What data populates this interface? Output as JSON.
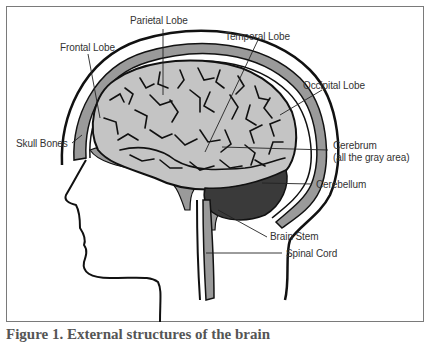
{
  "figure": {
    "labels": {
      "parietal_lobe": "Parietal Lobe",
      "frontal_lobe": "Frontal Lobe",
      "temporal_lobe": "Temporal Lobe",
      "occipital_lobe": "Occipital Lobe",
      "skull_bones": "Skull Bones",
      "cerebrum": "Cerebrum",
      "cerebrum_note": "(all the gray area)",
      "cerebellum": "Cerebellum",
      "brain_stem": "Brain Stem",
      "spinal_cord": "Spinal Cord"
    },
    "caption": "Figure 1. External structures of the brain",
    "colors": {
      "cerebrum": "#c4c4c4",
      "cerebellum": "#3a3a3a",
      "skull_band": "#9a9a9a",
      "outline": "#111111",
      "frame_border": "#7a7a7a"
    }
  }
}
